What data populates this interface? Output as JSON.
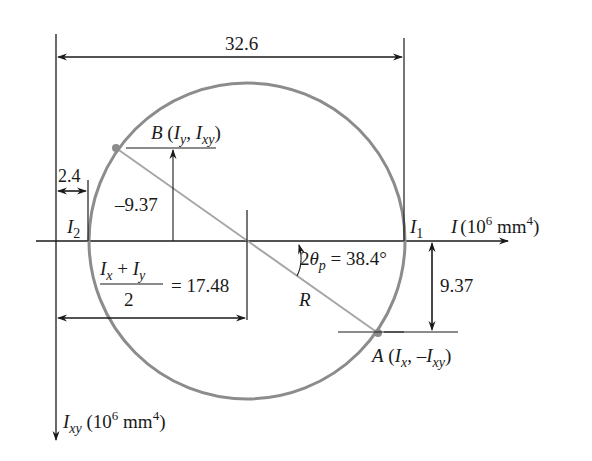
{
  "diagram": {
    "axes": {
      "horizontal_label_symbol": "I",
      "horizontal_label_unit": "(10",
      "horizontal_label_exp": "6",
      "horizontal_label_unit2": " mm",
      "horizontal_label_exp2": "4",
      "horizontal_label_close": ")",
      "vertical_label_symbol": "I",
      "vertical_label_sub": "xy",
      "vertical_label_unit": " (10",
      "vertical_label_exp": "6",
      "vertical_label_unit2": " mm",
      "vertical_label_exp2": "4",
      "vertical_label_close": ")"
    },
    "points": {
      "B": {
        "name": "B",
        "open": " (",
        "sym1": "I",
        "sub1": "y",
        "sep": ", ",
        "sym2": "I",
        "sub2": "xy",
        "close": ")"
      },
      "A": {
        "name": "A",
        "open": " (",
        "sym1": "I",
        "sub1": "x",
        "sep": ", –",
        "sym2": "I",
        "sub2": "xy",
        "close": ")"
      }
    },
    "principal": {
      "I1_sym": "I",
      "I1_sub": "1",
      "I2_sym": "I",
      "I2_sub": "2"
    },
    "dimensions": {
      "total": "32.6",
      "offset": "2.4",
      "B_ordinate": "–9.37",
      "A_ordinate": "9.37",
      "center_num_a": "I",
      "center_num_a_sub": "x",
      "center_plus": " + ",
      "center_num_b": "I",
      "center_num_b_sub": "y",
      "center_den": "2",
      "center_value": "= 17.48",
      "radius": "R",
      "angle_prefix": "2",
      "angle_sym": "θ",
      "angle_sub": "p",
      "angle_value": " = 38.4°"
    },
    "colors": {
      "circle": "#8c8c8c",
      "diameter": "#a6a6a6",
      "lines": "#1a1a1a"
    }
  }
}
